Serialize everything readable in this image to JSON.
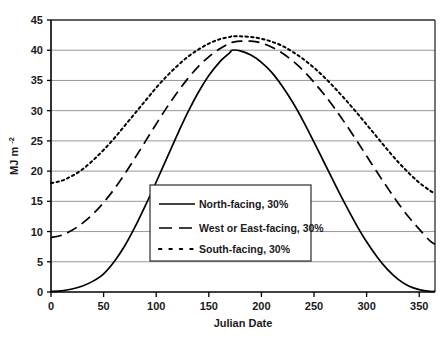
{
  "chart_data": {
    "type": "line",
    "title": "",
    "xlabel": "Julian Date",
    "ylabel": "MJ m",
    "ylabel_exponent": "-2",
    "xlim": [
      0,
      365
    ],
    "ylim": [
      0,
      45
    ],
    "xticks": [
      0,
      50,
      100,
      150,
      200,
      250,
      300,
      350
    ],
    "xtick_labels": [
      "0",
      "50",
      "100",
      "150",
      "200",
      "250",
      "300",
      "350"
    ],
    "yticks": [
      0,
      5,
      10,
      15,
      20,
      25,
      30,
      35,
      40,
      45
    ],
    "ytick_labels": [
      "0",
      "5",
      "10",
      "15",
      "20",
      "25",
      "30",
      "35",
      "40",
      "45"
    ],
    "grid": "horizontal",
    "legend_position": "center",
    "x": [
      0,
      10,
      20,
      30,
      40,
      50,
      60,
      70,
      80,
      90,
      100,
      110,
      120,
      130,
      140,
      150,
      160,
      170,
      172,
      180,
      190,
      200,
      210,
      220,
      230,
      240,
      250,
      260,
      270,
      280,
      290,
      300,
      310,
      320,
      330,
      340,
      350,
      360,
      365
    ],
    "series": [
      {
        "name": "North-facing, 30%",
        "style": "solid",
        "color": "#000000",
        "values": [
          0.1,
          0.2,
          0.5,
          1.0,
          1.8,
          3.0,
          5.0,
          7.6,
          10.8,
          14.4,
          18.2,
          22.1,
          26.0,
          29.7,
          33.0,
          35.8,
          38.0,
          39.6,
          40.0,
          39.9,
          39.2,
          38.0,
          36.3,
          34.0,
          31.3,
          28.2,
          24.8,
          21.3,
          17.8,
          14.4,
          11.2,
          8.3,
          5.8,
          3.7,
          2.1,
          1.0,
          0.4,
          0.1,
          0.1
        ]
      },
      {
        "name": "West or East-facing, 30%",
        "style": "dashed",
        "color": "#000000",
        "values": [
          9.0,
          9.4,
          10.2,
          11.4,
          12.9,
          14.8,
          17.0,
          19.5,
          22.2,
          25.0,
          27.8,
          30.5,
          33.0,
          35.3,
          37.3,
          38.9,
          40.2,
          41.2,
          41.3,
          41.5,
          41.5,
          41.2,
          40.5,
          39.5,
          38.2,
          36.6,
          34.7,
          32.6,
          30.3,
          27.8,
          25.2,
          22.5,
          19.8,
          17.2,
          14.7,
          12.4,
          10.4,
          8.5,
          7.9
        ]
      },
      {
        "name": "South-facing, 30%",
        "style": "dotted",
        "color": "#000000",
        "values": [
          18.0,
          18.4,
          19.2,
          20.3,
          21.8,
          23.5,
          25.4,
          27.5,
          29.6,
          31.7,
          33.8,
          35.7,
          37.4,
          38.9,
          40.1,
          41.1,
          41.8,
          42.2,
          42.3,
          42.3,
          42.2,
          41.9,
          41.4,
          40.7,
          39.7,
          38.5,
          37.1,
          35.5,
          33.7,
          31.8,
          29.8,
          27.7,
          25.6,
          23.5,
          21.5,
          19.7,
          18.1,
          16.8,
          16.3
        ]
      }
    ]
  },
  "legend": {
    "items": [
      {
        "label": "North-facing, 30%",
        "style": "solid"
      },
      {
        "label": "West or East-facing, 30%",
        "style": "dashed"
      },
      {
        "label": "South-facing, 30%",
        "style": "dotted"
      }
    ]
  }
}
